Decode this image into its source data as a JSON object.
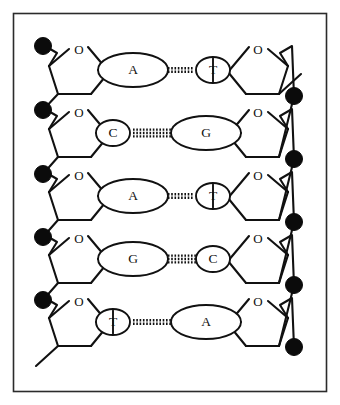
{
  "figure": {
    "border_color": "#2b2b2b",
    "line_color": "#111111",
    "phosphate_color": "#0b0b0b",
    "background": "#ffffff"
  },
  "labels": {
    "sugar_oxygen": "O"
  },
  "rows": [
    {
      "index": 0,
      "y": 70,
      "left_base": "A",
      "right_base": "T",
      "left_base_size": "large",
      "right_base_size": "small",
      "hbond_count": 2,
      "hbond_x1": 158,
      "hbond_x2": 193
    },
    {
      "index": 1,
      "y": 133,
      "left_base": "C",
      "right_base": "G",
      "left_base_size": "small",
      "right_base_size": "large",
      "hbond_count": 3,
      "hbond_x1": 133,
      "hbond_x2": 176
    },
    {
      "index": 2,
      "y": 196,
      "left_base": "A",
      "right_base": "T",
      "left_base_size": "large",
      "right_base_size": "small",
      "hbond_count": 2,
      "hbond_x1": 158,
      "hbond_x2": 193
    },
    {
      "index": 3,
      "y": 259,
      "left_base": "G",
      "right_base": "C",
      "left_base_size": "large",
      "right_base_size": "small",
      "hbond_count": 3,
      "hbond_x1": 158,
      "hbond_x2": 198
    },
    {
      "index": 4,
      "y": 322,
      "left_base": "T",
      "right_base": "A",
      "left_base_size": "small",
      "right_base_size": "large",
      "hbond_count": 2,
      "hbond_x1": 133,
      "hbond_x2": 176
    }
  ],
  "phosphates": {
    "left_y": [
      46,
      110,
      174,
      237,
      300
    ],
    "right_y": [
      96,
      159,
      222,
      285,
      347
    ],
    "left_x": 43,
    "right_x": 294,
    "radius": 8.5
  },
  "free_ends": {
    "top_right": "bond-stub",
    "bottom_left": "bond-stub"
  }
}
